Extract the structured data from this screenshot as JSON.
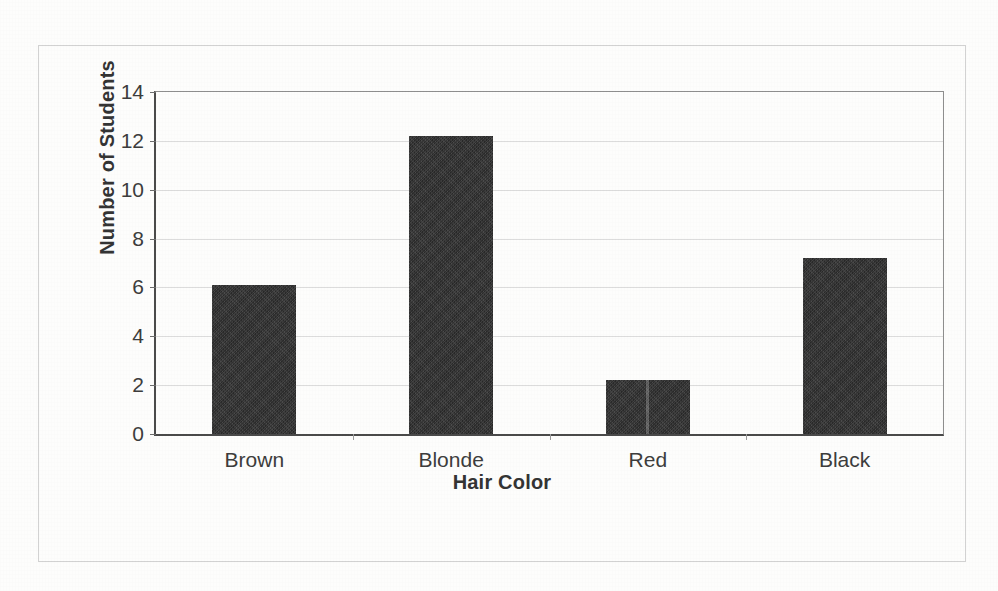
{
  "chart_data": {
    "type": "bar",
    "title": "",
    "categories": [
      "Brown",
      "Blonde",
      "Red",
      "Black"
    ],
    "values": [
      6.1,
      12.2,
      2.2,
      7.2
    ],
    "xlabel": "Hair Color",
    "ylabel": "Number of Students",
    "ylim": [
      0,
      14
    ],
    "yticks": [
      0,
      2,
      4,
      6,
      8,
      10,
      12,
      14
    ],
    "ytick_labels": [
      "0",
      "2",
      "4",
      "6",
      "8",
      "10",
      "12",
      "14"
    ],
    "grid": true,
    "legend": false,
    "bar_color": "#343434",
    "axis_color": "#4a4a4a",
    "gridline_color": "#dcdcdc",
    "frame_color": "#d2d2d2",
    "background": "#fdfdfc"
  }
}
